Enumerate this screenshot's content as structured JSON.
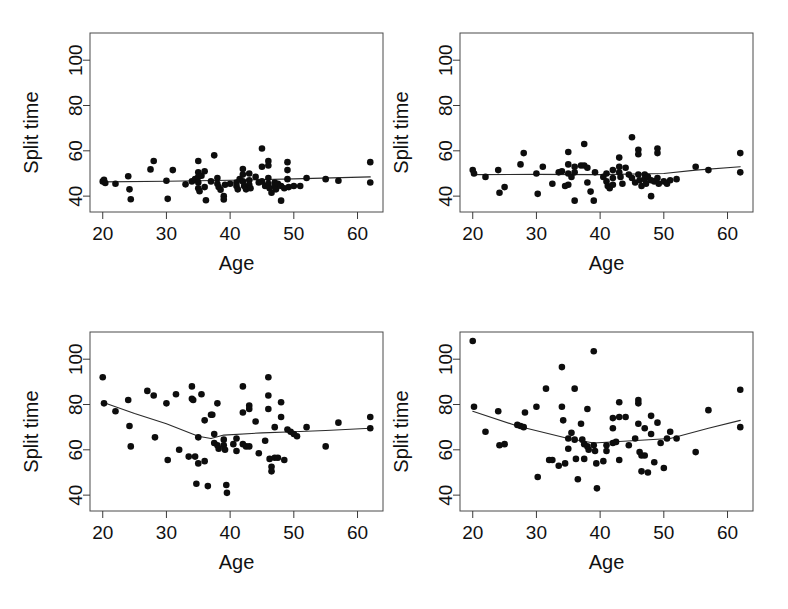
{
  "figure": {
    "background_color": "#ffffff",
    "point_color": "#0d0d0d",
    "line_color": "#2b2b2b",
    "frame_color": "#4a4a4a",
    "panel_count": 4,
    "layout": "2x2 grid of scatter plots"
  },
  "chart_data": [
    {
      "id": "panel-top-left",
      "type": "scatter",
      "title": "",
      "xlabel": "Age",
      "ylabel": "Split time",
      "xlim": [
        18,
        64
      ],
      "ylim": [
        33,
        112
      ],
      "xticks": [
        20,
        30,
        40,
        50,
        60
      ],
      "yticks": [
        40,
        60,
        80,
        100
      ],
      "grid": false,
      "legend": "none",
      "points": [
        [
          20.0,
          46.5
        ],
        [
          20.2,
          47.2
        ],
        [
          20.4,
          45.8
        ],
        [
          22.0,
          45.5
        ],
        [
          24.0,
          48.8
        ],
        [
          24.2,
          43.0
        ],
        [
          24.4,
          38.6
        ],
        [
          27.5,
          51.8
        ],
        [
          28.0,
          55.5
        ],
        [
          30.0,
          46.8
        ],
        [
          30.2,
          38.8
        ],
        [
          31.0,
          51.5
        ],
        [
          33.0,
          45.2
        ],
        [
          34.0,
          46.5
        ],
        [
          34.5,
          47.5
        ],
        [
          35.0,
          55.5
        ],
        [
          35.0,
          50.5
        ],
        [
          35.0,
          48.5
        ],
        [
          35.0,
          46.0
        ],
        [
          35.0,
          43.5
        ],
        [
          35.2,
          42.2
        ],
        [
          35.5,
          49.0
        ],
        [
          36.0,
          51.0
        ],
        [
          36.0,
          44.0
        ],
        [
          36.2,
          38.2
        ],
        [
          37.0,
          46.5
        ],
        [
          37.5,
          58.0
        ],
        [
          38.0,
          48.0
        ],
        [
          38.0,
          45.5
        ],
        [
          38.2,
          44.0
        ],
        [
          38.5,
          42.8
        ],
        [
          39.0,
          40.0
        ],
        [
          39.0,
          38.5
        ],
        [
          39.2,
          45.0
        ],
        [
          40.0,
          45.5
        ],
        [
          41.0,
          46.0
        ],
        [
          41.0,
          44.5
        ],
        [
          41.2,
          43.0
        ],
        [
          41.5,
          47.5
        ],
        [
          42.0,
          52.0
        ],
        [
          42.0,
          49.5
        ],
        [
          42.0,
          46.5
        ],
        [
          42.2,
          44.5
        ],
        [
          42.5,
          43.0
        ],
        [
          43.0,
          50.0
        ],
        [
          43.0,
          47.0
        ],
        [
          43.0,
          45.0
        ],
        [
          43.2,
          43.5
        ],
        [
          44.0,
          48.5
        ],
        [
          44.5,
          46.0
        ],
        [
          45.0,
          61.0
        ],
        [
          45.0,
          53.0
        ],
        [
          45.0,
          46.5
        ],
        [
          45.5,
          44.5
        ],
        [
          46.0,
          55.5
        ],
        [
          46.0,
          53.5
        ],
        [
          46.0,
          48.0
        ],
        [
          46.0,
          45.5
        ],
        [
          46.2,
          43.5
        ],
        [
          46.5,
          41.5
        ],
        [
          47.0,
          46.0
        ],
        [
          47.0,
          44.5
        ],
        [
          47.2,
          43.0
        ],
        [
          47.5,
          45.5
        ],
        [
          48.0,
          44.5
        ],
        [
          48.0,
          38.0
        ],
        [
          48.5,
          43.5
        ],
        [
          49.0,
          55.0
        ],
        [
          49.0,
          51.5
        ],
        [
          49.0,
          47.5
        ],
        [
          49.2,
          44.0
        ],
        [
          50.0,
          44.5
        ],
        [
          51.0,
          44.5
        ],
        [
          52.0,
          48.0
        ],
        [
          55.0,
          47.5
        ],
        [
          57.0,
          46.8
        ],
        [
          62.0,
          55.0
        ],
        [
          62.0,
          46.0
        ]
      ],
      "fit_line": [
        [
          20,
          46.3
        ],
        [
          30,
          46.6
        ],
        [
          40,
          47.0
        ],
        [
          50,
          47.6
        ],
        [
          62,
          48.5
        ]
      ],
      "fit_line_description": "nearly flat, slightly increasing trend"
    },
    {
      "id": "panel-top-right",
      "type": "scatter",
      "title": "",
      "xlabel": "Age",
      "ylabel": "Split time",
      "xlim": [
        18,
        64
      ],
      "ylim": [
        33,
        112
      ],
      "xticks": [
        20,
        30,
        40,
        50,
        60
      ],
      "yticks": [
        40,
        60,
        80,
        100
      ],
      "grid": false,
      "legend": "none",
      "points": [
        [
          20.0,
          51.5
        ],
        [
          20.2,
          50.0
        ],
        [
          22.0,
          48.5
        ],
        [
          24.0,
          51.5
        ],
        [
          24.2,
          41.5
        ],
        [
          25.0,
          44.0
        ],
        [
          27.5,
          54.0
        ],
        [
          28.0,
          59.0
        ],
        [
          30.0,
          50.0
        ],
        [
          30.2,
          41.0
        ],
        [
          31.0,
          53.0
        ],
        [
          32.5,
          45.5
        ],
        [
          33.5,
          50.5
        ],
        [
          34.0,
          51.0
        ],
        [
          34.5,
          44.5
        ],
        [
          35.0,
          59.5
        ],
        [
          35.0,
          54.0
        ],
        [
          35.0,
          50.0
        ],
        [
          35.0,
          45.0
        ],
        [
          35.5,
          48.5
        ],
        [
          36.0,
          53.0
        ],
        [
          36.0,
          50.5
        ],
        [
          36.0,
          38.0
        ],
        [
          37.0,
          53.5
        ],
        [
          37.5,
          63.0
        ],
        [
          37.5,
          53.5
        ],
        [
          38.0,
          52.5
        ],
        [
          38.0,
          46.0
        ],
        [
          38.5,
          42.0
        ],
        [
          39.0,
          38.0
        ],
        [
          39.2,
          50.5
        ],
        [
          40.5,
          48.5
        ],
        [
          41.0,
          50.0
        ],
        [
          41.0,
          46.5
        ],
        [
          41.2,
          44.5
        ],
        [
          41.5,
          43.5
        ],
        [
          42.0,
          51.5
        ],
        [
          42.0,
          48.0
        ],
        [
          42.0,
          45.0
        ],
        [
          43.0,
          57.0
        ],
        [
          43.0,
          53.0
        ],
        [
          43.0,
          50.5
        ],
        [
          43.2,
          48.5
        ],
        [
          43.5,
          45.5
        ],
        [
          44.0,
          52.5
        ],
        [
          44.5,
          49.5
        ],
        [
          45.0,
          66.0
        ],
        [
          45.0,
          48.0
        ],
        [
          45.5,
          46.0
        ],
        [
          46.0,
          60.5
        ],
        [
          46.0,
          58.5
        ],
        [
          46.0,
          49.5
        ],
        [
          46.2,
          47.0
        ],
        [
          46.5,
          44.5
        ],
        [
          47.0,
          49.5
        ],
        [
          47.0,
          47.5
        ],
        [
          47.2,
          45.5
        ],
        [
          47.5,
          48.5
        ],
        [
          48.0,
          47.0
        ],
        [
          48.0,
          40.0
        ],
        [
          48.5,
          46.5
        ],
        [
          49.0,
          61.0
        ],
        [
          49.0,
          59.0
        ],
        [
          49.0,
          48.0
        ],
        [
          49.2,
          45.5
        ],
        [
          50.0,
          46.5
        ],
        [
          50.5,
          45.5
        ],
        [
          51.0,
          47.0
        ],
        [
          52.0,
          47.5
        ],
        [
          55.0,
          53.0
        ],
        [
          57.0,
          51.5
        ],
        [
          62.0,
          59.0
        ],
        [
          62.0,
          50.5
        ]
      ],
      "fit_line": [
        [
          20,
          49.5
        ],
        [
          30,
          49.6
        ],
        [
          40,
          49.5
        ],
        [
          50,
          50.0
        ],
        [
          55,
          51.5
        ],
        [
          62,
          53.0
        ]
      ],
      "fit_line_description": "flat then rising after age 50"
    },
    {
      "id": "panel-bottom-left",
      "type": "scatter",
      "title": "",
      "xlabel": "Age",
      "ylabel": "Split time",
      "xlim": [
        18,
        64
      ],
      "ylim": [
        33,
        112
      ],
      "xticks": [
        20,
        30,
        40,
        50,
        60
      ],
      "yticks": [
        40,
        60,
        80,
        100
      ],
      "grid": false,
      "legend": "none",
      "points": [
        [
          20.0,
          92.0
        ],
        [
          20.2,
          80.5
        ],
        [
          22.0,
          77.0
        ],
        [
          24.0,
          82.0
        ],
        [
          24.2,
          70.5
        ],
        [
          24.4,
          61.5
        ],
        [
          27.0,
          86.0
        ],
        [
          28.0,
          84.0
        ],
        [
          28.2,
          65.5
        ],
        [
          30.0,
          80.5
        ],
        [
          30.2,
          55.5
        ],
        [
          31.5,
          84.5
        ],
        [
          32.0,
          60.0
        ],
        [
          33.5,
          57.0
        ],
        [
          34.0,
          88.0
        ],
        [
          34.0,
          82.5
        ],
        [
          34.2,
          82.0
        ],
        [
          34.5,
          57.0
        ],
        [
          34.7,
          45.0
        ],
        [
          35.0,
          65.5
        ],
        [
          35.0,
          54.0
        ],
        [
          35.5,
          84.5
        ],
        [
          36.0,
          73.0
        ],
        [
          36.0,
          55.0
        ],
        [
          36.5,
          44.0
        ],
        [
          37.0,
          75.5
        ],
        [
          37.2,
          75.5
        ],
        [
          37.5,
          67.0
        ],
        [
          37.5,
          63.0
        ],
        [
          38.0,
          80.5
        ],
        [
          38.0,
          62.0
        ],
        [
          38.2,
          60.5
        ],
        [
          39.0,
          64.5
        ],
        [
          39.0,
          62.0
        ],
        [
          39.2,
          60.0
        ],
        [
          39.4,
          44.5
        ],
        [
          39.5,
          41.0
        ],
        [
          40.5,
          62.5
        ],
        [
          41.0,
          65.0
        ],
        [
          41.0,
          59.5
        ],
        [
          42.0,
          88.0
        ],
        [
          42.0,
          76.5
        ],
        [
          42.0,
          62.5
        ],
        [
          42.5,
          61.5
        ],
        [
          43.0,
          79.5
        ],
        [
          43.0,
          78.0
        ],
        [
          43.0,
          61.5
        ],
        [
          44.0,
          72.5
        ],
        [
          44.5,
          58.5
        ],
        [
          45.5,
          64.0
        ],
        [
          46.0,
          92.0
        ],
        [
          46.0,
          84.0
        ],
        [
          46.0,
          78.0
        ],
        [
          46.2,
          56.0
        ],
        [
          46.5,
          52.5
        ],
        [
          46.5,
          50.5
        ],
        [
          47.0,
          70.0
        ],
        [
          47.0,
          56.5
        ],
        [
          47.5,
          56.5
        ],
        [
          48.0,
          81.0
        ],
        [
          48.0,
          74.5
        ],
        [
          48.5,
          55.5
        ],
        [
          49.0,
          69.0
        ],
        [
          49.5,
          68.0
        ],
        [
          50.0,
          67.0
        ],
        [
          50.5,
          66.0
        ],
        [
          52.0,
          70.0
        ],
        [
          55.0,
          61.5
        ],
        [
          57.0,
          72.0
        ],
        [
          62.0,
          74.5
        ],
        [
          62.0,
          69.5
        ]
      ],
      "fit_line": [
        [
          20,
          81.0
        ],
        [
          25,
          76.0
        ],
        [
          30,
          71.5
        ],
        [
          35,
          66.0
        ],
        [
          37,
          65.0
        ],
        [
          39,
          66.5
        ],
        [
          45,
          67.5
        ],
        [
          50,
          68.0
        ],
        [
          55,
          68.5
        ],
        [
          62,
          69.5
        ]
      ],
      "fit_line_description": "declining from 81 to about 65 by age 37, then gently rising"
    },
    {
      "id": "panel-bottom-right",
      "type": "scatter",
      "title": "",
      "xlabel": "Age",
      "ylabel": "Split time",
      "xlim": [
        18,
        64
      ],
      "ylim": [
        33,
        112
      ],
      "xticks": [
        20,
        30,
        40,
        50,
        60
      ],
      "yticks": [
        40,
        60,
        80,
        100
      ],
      "grid": false,
      "legend": "none",
      "points": [
        [
          20.0,
          108.0
        ],
        [
          20.2,
          79.0
        ],
        [
          22.0,
          68.0
        ],
        [
          24.0,
          77.0
        ],
        [
          24.2,
          62.0
        ],
        [
          25.0,
          62.5
        ],
        [
          27.0,
          71.0
        ],
        [
          27.5,
          70.5
        ],
        [
          28.0,
          70.0
        ],
        [
          28.2,
          76.5
        ],
        [
          30.0,
          79.0
        ],
        [
          30.2,
          48.0
        ],
        [
          31.5,
          87.0
        ],
        [
          32.0,
          55.5
        ],
        [
          32.5,
          55.5
        ],
        [
          33.5,
          53.0
        ],
        [
          34.0,
          96.5
        ],
        [
          34.0,
          79.0
        ],
        [
          34.2,
          73.0
        ],
        [
          34.5,
          54.0
        ],
        [
          35.0,
          65.0
        ],
        [
          35.0,
          60.5
        ],
        [
          35.5,
          67.5
        ],
        [
          36.0,
          87.0
        ],
        [
          36.0,
          64.5
        ],
        [
          36.2,
          56.0
        ],
        [
          36.5,
          47.0
        ],
        [
          37.0,
          71.5
        ],
        [
          37.2,
          64.5
        ],
        [
          37.5,
          62.5
        ],
        [
          37.5,
          56.0
        ],
        [
          38.0,
          78.0
        ],
        [
          38.0,
          61.5
        ],
        [
          38.2,
          60.0
        ],
        [
          39.0,
          103.5
        ],
        [
          39.0,
          62.0
        ],
        [
          39.2,
          59.5
        ],
        [
          39.4,
          54.0
        ],
        [
          39.5,
          43.0
        ],
        [
          40.5,
          55.0
        ],
        [
          41.0,
          62.0
        ],
        [
          41.0,
          59.5
        ],
        [
          42.0,
          74.0
        ],
        [
          42.0,
          69.5
        ],
        [
          42.0,
          63.0
        ],
        [
          42.5,
          63.5
        ],
        [
          43.0,
          81.0
        ],
        [
          43.0,
          74.5
        ],
        [
          43.0,
          55.5
        ],
        [
          44.0,
          74.5
        ],
        [
          44.5,
          62.0
        ],
        [
          45.5,
          65.0
        ],
        [
          46.0,
          82.0
        ],
        [
          46.0,
          80.5
        ],
        [
          46.0,
          71.5
        ],
        [
          46.2,
          59.0
        ],
        [
          46.5,
          57.5
        ],
        [
          46.5,
          50.5
        ],
        [
          47.0,
          69.5
        ],
        [
          47.0,
          57.5
        ],
        [
          47.5,
          50.0
        ],
        [
          48.0,
          75.0
        ],
        [
          48.0,
          67.0
        ],
        [
          48.5,
          54.5
        ],
        [
          49.0,
          72.0
        ],
        [
          49.5,
          63.0
        ],
        [
          50.0,
          52.0
        ],
        [
          50.5,
          65.0
        ],
        [
          51.0,
          68.0
        ],
        [
          52.0,
          65.0
        ],
        [
          55.0,
          59.0
        ],
        [
          57.0,
          77.5
        ],
        [
          62.0,
          86.5
        ],
        [
          62.0,
          70.0
        ]
      ],
      "fit_line": [
        [
          20,
          77.0
        ],
        [
          27,
          70.5
        ],
        [
          35,
          65.0
        ],
        [
          39,
          63.0
        ],
        [
          45,
          64.0
        ],
        [
          51,
          65.0
        ],
        [
          57,
          69.5
        ],
        [
          62,
          73.0
        ]
      ],
      "fit_line_description": "U-shaped: declines to about 63 near age 39, then rises to 73"
    }
  ]
}
